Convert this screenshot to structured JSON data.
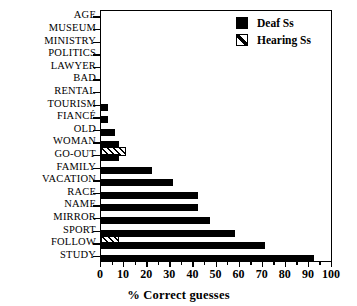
{
  "chart_data": {
    "type": "bar",
    "orientation": "horizontal",
    "title": "",
    "xlabel": "% Correct guesses",
    "ylabel": "",
    "xlim": [
      0,
      100
    ],
    "xticks": [
      0,
      10,
      20,
      30,
      40,
      50,
      60,
      70,
      80,
      90,
      100
    ],
    "grid": false,
    "legend_position": "top-right",
    "categories": [
      "AGE",
      "MUSEUM",
      "MINISTRY",
      "POLITICS",
      "LAWYER",
      "BAD",
      "RENTAL",
      "TOURISM",
      "FIANCÉ",
      "OLD",
      "WOMAN",
      "GO-OUT",
      "FAMILY",
      "VACATION",
      "RACE",
      "NAME",
      "MIRROR",
      "SPORT",
      "FOLLOW",
      "STUDY"
    ],
    "series": [
      {
        "name": "Deaf Ss",
        "color": "#000000",
        "pattern": "solid",
        "values": [
          0,
          0,
          0,
          0,
          0,
          0,
          0,
          3,
          3,
          6,
          8,
          8,
          22,
          31,
          42,
          42,
          47,
          58,
          71,
          92
        ]
      },
      {
        "name": "Hearing Ss",
        "color": "#000000",
        "pattern": "diagonal-hatch",
        "values": [
          0,
          0,
          0,
          0,
          0,
          0,
          0,
          0,
          0,
          0,
          0,
          11,
          0,
          0,
          0,
          0,
          0,
          0,
          8,
          0
        ]
      }
    ]
  },
  "legend": {
    "items": [
      {
        "label": "Deaf Ss",
        "swatch": "solid-square-icon"
      },
      {
        "label": "Hearing Ss",
        "swatch": "hatched-square-icon"
      }
    ]
  }
}
